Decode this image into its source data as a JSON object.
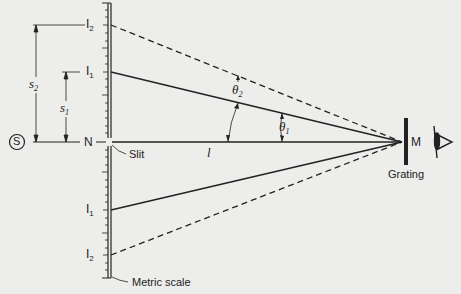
{
  "diagram": {
    "type": "diffraction-grating-setup",
    "labels": {
      "source": "S",
      "normal_point": "N",
      "slit": "Slit",
      "image1_top": {
        "base": "I",
        "sub": "1"
      },
      "image2_top": {
        "base": "I",
        "sub": "2"
      },
      "image1_bottom": {
        "base": "I",
        "sub": "1"
      },
      "image2_bottom": {
        "base": "I",
        "sub": "2"
      },
      "s1": {
        "base": "s",
        "sub": "1"
      },
      "s2": {
        "base": "s",
        "sub": "2"
      },
      "theta1": {
        "base": "θ",
        "sub": "1"
      },
      "theta2": {
        "base": "θ",
        "sub": "2"
      },
      "distance": "l",
      "grating_point": "M",
      "grating": "Grating",
      "scale": "Metric scale"
    },
    "colors": {
      "background": "#ededeb",
      "ink": "#222222"
    }
  }
}
